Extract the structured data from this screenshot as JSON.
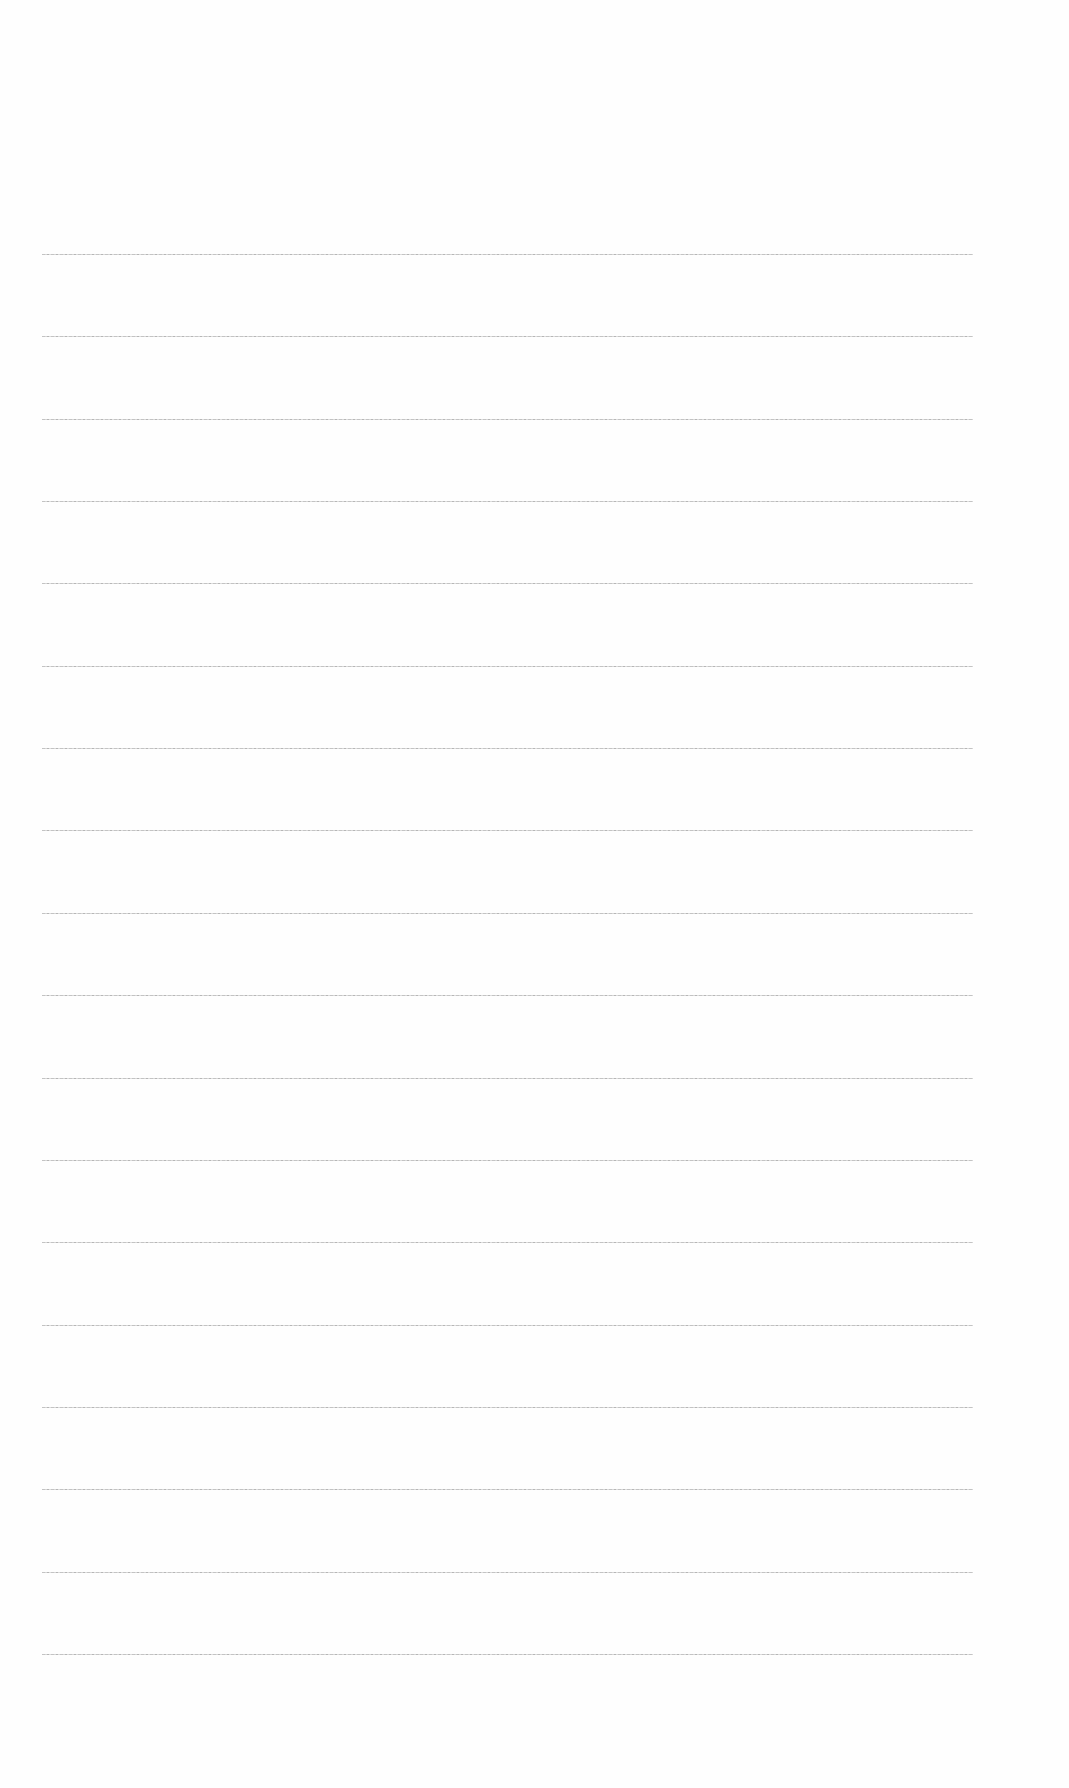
{
  "document": {
    "type": "ruled-sheet",
    "text": "",
    "background_color": "#fefefe",
    "line_color": "#b9b9b9"
  },
  "rules": {
    "count": 18,
    "first_y": 254,
    "spacing": 82.35,
    "left_x": 42,
    "right_x": 973
  }
}
